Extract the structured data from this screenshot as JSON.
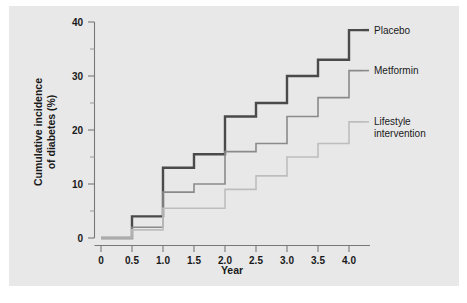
{
  "figure": {
    "background_color": "#ffffff",
    "panel_color": "#e8e8e8"
  },
  "chart_data": {
    "type": "line",
    "subtype": "step",
    "title": "",
    "xlabel": "Year",
    "ylabel": "Cumulative incidence of diabetes (%)",
    "ylabel_line1": "Cumulative incidence",
    "ylabel_line2": "of diabetes (%)",
    "x": [
      0,
      0.5,
      1.0,
      1.5,
      2.0,
      2.5,
      3.0,
      3.5,
      4.0
    ],
    "xlim": [
      0,
      4.3
    ],
    "ylim": [
      0,
      40
    ],
    "xticks": [
      0,
      0.5,
      1.0,
      1.5,
      2.0,
      2.5,
      3.0,
      3.5,
      4.0
    ],
    "xtick_labels": [
      "0",
      "0.5",
      "1.0",
      "1.5",
      "2.0",
      "2.5",
      "3.0",
      "3.5",
      "4.0"
    ],
    "yticks": [
      0,
      10,
      20,
      30,
      40
    ],
    "ytick_labels": [
      "0",
      "10",
      "20",
      "30",
      "40"
    ],
    "yticks_minor": [
      5,
      15,
      25,
      35
    ],
    "grid": false,
    "legend_position": "right-inline",
    "series": [
      {
        "name": "Placebo",
        "color": "#4a4a4a",
        "line_width": 2.4,
        "values": [
          0,
          4,
          13,
          15.5,
          22.5,
          25,
          30,
          33,
          38.5
        ],
        "label_y": 38.5
      },
      {
        "name": "Metformin",
        "color": "#8a8a8a",
        "line_width": 1.6,
        "values": [
          0,
          2,
          8.5,
          10,
          16,
          17.5,
          22.5,
          26,
          31
        ],
        "label_y": 31
      },
      {
        "name": "Lifestyle intervention",
        "name_line1": "Lifestyle",
        "name_line2": "intervention",
        "color": "#bdbdbd",
        "line_width": 1.6,
        "values": [
          0,
          1.5,
          5.5,
          5.5,
          9,
          11.5,
          15,
          17.5,
          21.5
        ],
        "label_y": 21.5
      }
    ]
  }
}
